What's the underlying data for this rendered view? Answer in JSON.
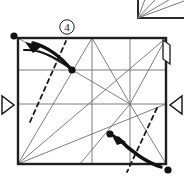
{
  "figure": {
    "type": "origami-folding-diagram",
    "step_label": "④",
    "step_number": 4,
    "colors": {
      "ink": "#1a1a1a",
      "crease_line": "#6e6e6e",
      "edge_line": "#2a2a2a",
      "paper": "#ffffff"
    },
    "sheet": {
      "name": "main-square-sheet",
      "left": 18,
      "top": 38,
      "right": 166,
      "bottom": 164
    },
    "previous_step_fragment": {
      "name": "previous-step-corner-fragment",
      "description": "bottom-left corner of preceding figure with radiating crease lines",
      "corner_x": 138,
      "corner_y": 18,
      "top_y": -14,
      "right_x": 184,
      "ray_endpoints": [
        [
          150,
          -14
        ],
        [
          166,
          -14
        ],
        [
          184,
          -8
        ],
        [
          184,
          2
        ]
      ]
    },
    "creases": {
      "horizontals": [
        70,
        104
      ],
      "verticals": [
        92,
        130
      ],
      "diagonals": [
        {
          "name": "crease-main-diagonal",
          "x1": 18,
          "y1": 164,
          "x2": 166,
          "y2": 38
        },
        {
          "name": "crease-lower-diagonal",
          "x1": 18,
          "y1": 164,
          "x2": 166,
          "y2": 104
        },
        {
          "name": "crease-bl-to-top-mid",
          "x1": 18,
          "y1": 164,
          "x2": 92,
          "y2": 38
        },
        {
          "name": "crease-topmid-to-center",
          "x1": 92,
          "y1": 38,
          "x2": 130,
          "y2": 104
        },
        {
          "name": "crease-center-to-bottom",
          "x1": 130,
          "y1": 104,
          "x2": 80,
          "y2": 164
        },
        {
          "name": "crease-center-to-topright",
          "x1": 130,
          "y1": 104,
          "x2": 166,
          "y2": 38
        },
        {
          "name": "crease-center-to-bottomright",
          "x1": 130,
          "y1": 104,
          "x2": 166,
          "y2": 164
        },
        {
          "name": "crease-center-to-bl",
          "x1": 130,
          "y1": 104,
          "x2": 18,
          "y2": 164
        }
      ]
    },
    "fold_lines_dashed": [
      {
        "name": "dashed-fold-upper-left",
        "x1": 30,
        "y1": 120,
        "x2": 66,
        "y2": 42
      },
      {
        "name": "dashed-fold-lower-right",
        "x1": 156,
        "y1": 110,
        "x2": 126,
        "y2": 170
      }
    ],
    "reference_dots": [
      {
        "name": "dot-top-left-corner",
        "cx": 14,
        "cy": 36,
        "r": 3.6
      },
      {
        "name": "dot-upper-crease-point",
        "cx": 72,
        "cy": 70,
        "r": 3.6
      },
      {
        "name": "dot-lower-crease-point",
        "cx": 110,
        "cy": 134,
        "r": 3.6
      },
      {
        "name": "dot-bottom-right-corner",
        "cx": 168,
        "cy": 170,
        "r": 3.6
      }
    ],
    "fold_arrows": [
      {
        "name": "fold-arrow-upper-left",
        "direction": "up-left",
        "from": [
          72,
          70
        ],
        "to": [
          28,
          46
        ],
        "path": "M 72 70 C 60 56 46 45 30 44",
        "tail_path": "M 26 50 C 40 48 56 54 70 68"
      },
      {
        "name": "fold-arrow-lower-right",
        "direction": "up-left",
        "from": [
          160,
          166
        ],
        "to": [
          112,
          135
        ],
        "path": "M 160 166 C 146 162 128 150 114 136",
        "tail_path": "M 162 160 C 146 156 130 145 116 132"
      }
    ],
    "edge_markers": [
      {
        "name": "edge-marker-left",
        "points": "2,96 2,114 14,105",
        "orientation": "points-right"
      },
      {
        "name": "edge-marker-right",
        "points": "182,96 182,114 170,105",
        "orientation": "points-left"
      }
    ],
    "flap": {
      "name": "right-edge-flap",
      "outline": "M 163 40 L 170 44 L 170 64 L 163 60 Z"
    }
  }
}
